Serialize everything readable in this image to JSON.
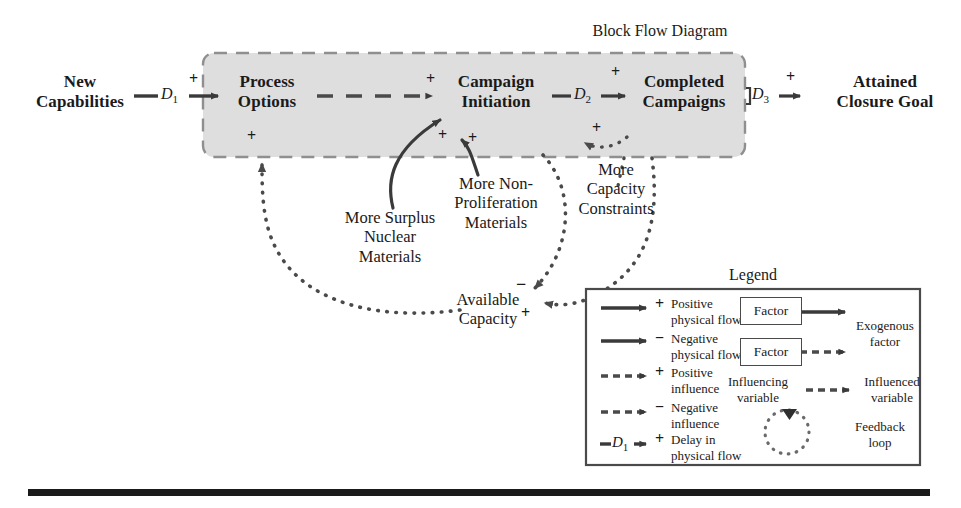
{
  "diagram": {
    "title": "Block Flow Diagram",
    "shaded_block_color": "#dedede",
    "nodes": [
      {
        "id": "new-capabilities",
        "label": "New\nCapabilities",
        "inside_block": false
      },
      {
        "id": "process-options",
        "label": "Process\nOptions",
        "inside_block": true
      },
      {
        "id": "campaign-initiation",
        "label": "Campaign\nInitiation",
        "inside_block": true
      },
      {
        "id": "completed-campaigns",
        "label": "Completed\nCampaigns",
        "inside_block": true
      },
      {
        "id": "attained-closure-goal",
        "label": "Attained\nClosure Goal",
        "inside_block": false
      }
    ],
    "external_factors": [
      {
        "id": "more-surplus-nuclear-materials",
        "label": "More Surplus\nNuclear\nMaterials",
        "sign": "+",
        "target": "campaign-initiation"
      },
      {
        "id": "more-non-proliferation-materials",
        "label": "More Non-\nProliferation\nMaterials",
        "sign": "+",
        "target": "campaign-initiation"
      },
      {
        "id": "more-capacity-constraints",
        "label": "More\nCapacity\nConstraints",
        "sign": "+",
        "target": "completed-campaigns"
      },
      {
        "id": "available-capacity",
        "label": "Available\nCapacity",
        "signs": [
          "−",
          "+"
        ]
      }
    ],
    "delays": [
      {
        "id": "d1",
        "label": "D",
        "sub": "1",
        "sign": "+",
        "from": "new-capabilities",
        "to": "process-options"
      },
      {
        "id": "d2",
        "label": "D",
        "sub": "2",
        "sign": "+",
        "from": "campaign-initiation",
        "to": "completed-campaigns"
      },
      {
        "id": "d3",
        "label": "D",
        "sub": "3",
        "sign": "+",
        "from": "completed-campaigns",
        "to": "attained-closure-goal"
      }
    ],
    "signs": {
      "process_options_in": "+",
      "process_options_bottom": "+",
      "campaign_initiation_in": "+",
      "campaign_initiation_bottom_left": "+",
      "campaign_initiation_bottom_right": "+",
      "completed_campaigns_top": "+",
      "completed_campaigns_bottom": "+",
      "attained_closure_goal_in": "+",
      "available_capacity_neg": "−",
      "available_capacity_pos": "+"
    }
  },
  "legend": {
    "title": "Legend",
    "rows": [
      {
        "id": "positive-physical-flow",
        "sign": "+",
        "label": "Positive\nphysical flow",
        "style": "solid"
      },
      {
        "id": "negative-physical-flow",
        "sign": "−",
        "label": "Negative\nphysical flow",
        "style": "solid"
      },
      {
        "id": "positive-influence",
        "sign": "+",
        "label": "Positive\ninfluence",
        "style": "dashed"
      },
      {
        "id": "negative-influence",
        "sign": "−",
        "label": "Negative\ninfluence",
        "style": "dashed"
      },
      {
        "id": "delay-in-physical-flow",
        "sign": "+",
        "label": "Delay in\nphysical flow",
        "style": "delay",
        "delay_label": "D",
        "delay_sub": "1"
      }
    ],
    "right_items": [
      {
        "id": "exogenous-factor",
        "box_label": "Factor",
        "label": "Exogenous\nfactor",
        "arrow": "solid"
      },
      {
        "id": "exogenous-factor-dashed",
        "box_label": "Factor",
        "arrow": "dashed"
      },
      {
        "id": "influence-pair",
        "from_label": "Influencing\nvariable",
        "to_label": "Influenced\nvariable",
        "arrow": "dashed"
      },
      {
        "id": "feedback-loop",
        "label": "Feedback\nloop",
        "glyph": "dotted-circle"
      }
    ]
  }
}
